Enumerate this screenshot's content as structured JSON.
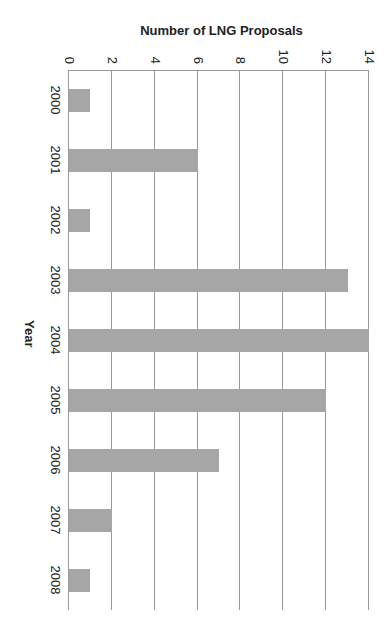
{
  "chart_data": {
    "type": "bar",
    "title": "",
    "xlabel": "Year",
    "ylabel": "Number of LNG Proposals",
    "categories": [
      "2000",
      "2001",
      "2002",
      "2003",
      "2004",
      "2005",
      "2006",
      "2007",
      "2008"
    ],
    "values": [
      1,
      6,
      1,
      13,
      14,
      12,
      7,
      2,
      1
    ],
    "ylim": [
      0,
      14
    ],
    "yticks": [
      "0",
      "2",
      "4",
      "6",
      "8",
      "10",
      "12",
      "14"
    ],
    "grid": true,
    "legend": null,
    "orientation_note": "figure rotated 90 degrees clockwise",
    "bar_color": "#a6a6a6"
  }
}
